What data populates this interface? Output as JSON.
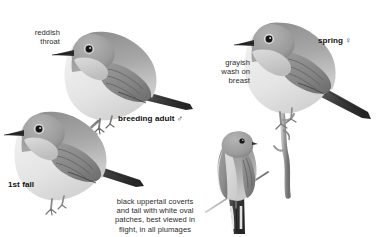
{
  "plate": {
    "subject": "Red-breasted Flycatcher",
    "background_color": "#ffffff",
    "ink_color": "#2b2b2b",
    "medium": "grayscale field-guide painting"
  },
  "annotations": {
    "reddish_throat": "reddish\nthroat",
    "grayish_wash": "grayish\nwash on\nbreast",
    "breeding_adult": "breeding adult ♂",
    "spring_female": "spring ♀",
    "first_fall": "1st fall",
    "tail_caption": "black uppertail coverts\nand tail with white oval\npatches, best viewed in\nflight, in all plumages"
  },
  "figures": [
    {
      "id": "breeding-adult-male",
      "label": "breeding adult ♂",
      "pose": "perched on twig, facing left",
      "plumage_notes": "reddish throat"
    },
    {
      "id": "first-fall",
      "label": "1st fall",
      "pose": "perched, facing left",
      "plumage_notes": "plain buff breast, dark tail"
    },
    {
      "id": "spring-female",
      "label": "spring ♀",
      "pose": "perched on upright branch, facing left",
      "plumage_notes": "grayish wash on breast"
    },
    {
      "id": "rear-view-female",
      "label": "♀",
      "pose": "rear view on diagonal twig",
      "plumage_notes": "black tail with white oval patches"
    }
  ],
  "symbols": {
    "male": "♂",
    "female": "♀"
  }
}
